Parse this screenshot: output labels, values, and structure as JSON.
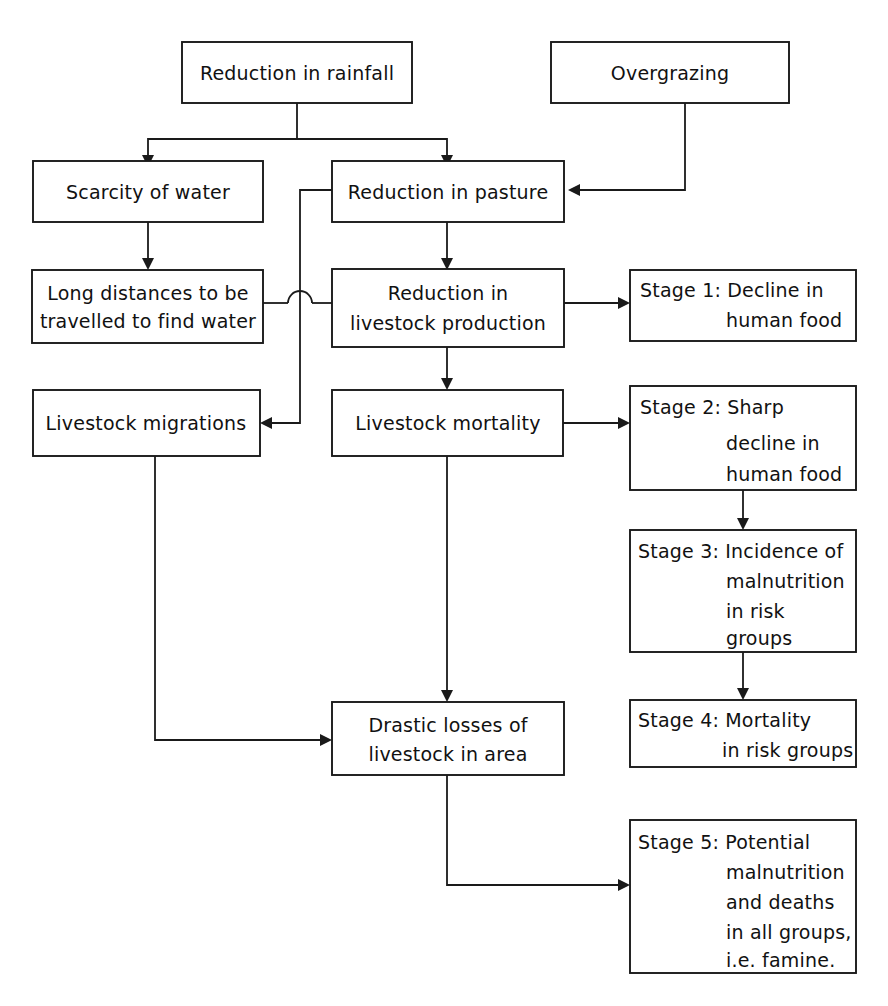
{
  "diagram": {
    "type": "flowchart",
    "colors": {
      "background": "#ffffff",
      "stroke": "#1a1a1a",
      "text": "#111111"
    },
    "nodes": [
      {
        "id": "reduction-in-rainfall",
        "lines": [
          "Reduction in rainfall"
        ],
        "align": "center"
      },
      {
        "id": "overgrazing",
        "lines": [
          "Overgrazing"
        ],
        "align": "center"
      },
      {
        "id": "scarcity-of-water",
        "lines": [
          "Scarcity of water"
        ],
        "align": "center"
      },
      {
        "id": "reduction-in-pasture",
        "lines": [
          "Reduction  in  pasture"
        ],
        "align": "center"
      },
      {
        "id": "long-distances-to-find-water",
        "lines": [
          "Long distances to be",
          "travelled to find water"
        ],
        "align": "center"
      },
      {
        "id": "reduction-in-livestock-production",
        "lines": [
          "Reduction  in",
          "livestock  production"
        ],
        "align": "center"
      },
      {
        "id": "stage-1-decline-in-human-food",
        "lines": [
          "Stage 1:  Decline in",
          "human food"
        ],
        "align": "stage"
      },
      {
        "id": "livestock-migrations",
        "lines": [
          "Livestock  migrations"
        ],
        "align": "center"
      },
      {
        "id": "livestock-mortality",
        "lines": [
          "Livestock  mortality"
        ],
        "align": "center"
      },
      {
        "id": "stage-2-sharp-decline-in-human-food",
        "lines": [
          "Stage 2:  Sharp",
          "decline in",
          "human food"
        ],
        "align": "stage"
      },
      {
        "id": "stage-3-incidence-of-malnutrition",
        "lines": [
          "Stage 3:  Incidence of",
          "malnutrition",
          "in risk",
          "groups"
        ],
        "align": "stage"
      },
      {
        "id": "stage-4-mortality-in-risk-groups",
        "lines": [
          "Stage 4:  Mortality",
          "in risk groups"
        ],
        "align": "stage"
      },
      {
        "id": "drastic-losses-of-livestock",
        "lines": [
          "Drastic losses of",
          "livestock in area"
        ],
        "align": "center"
      },
      {
        "id": "stage-5-potential-malnutrition-famine",
        "lines": [
          "Stage 5:  Potential",
          "malnutrition",
          "and  deaths",
          "in all groups,",
          "i.e. famine."
        ],
        "align": "stage"
      }
    ],
    "edges": [
      {
        "id": "rainfall-to-scarcity",
        "from": "reduction-in-rainfall",
        "to": "scarcity-of-water"
      },
      {
        "id": "rainfall-to-pasture",
        "from": "reduction-in-rainfall",
        "to": "reduction-in-pasture"
      },
      {
        "id": "overgrazing-to-pasture",
        "from": "overgrazing",
        "to": "reduction-in-pasture"
      },
      {
        "id": "scarcity-to-long-distances",
        "from": "scarcity-of-water",
        "to": "long-distances-to-find-water"
      },
      {
        "id": "pasture-to-livestock-production",
        "from": "reduction-in-pasture",
        "to": "reduction-in-livestock-production"
      },
      {
        "id": "long-distances-to-livestock-production",
        "from": "long-distances-to-find-water",
        "to": "reduction-in-livestock-production"
      },
      {
        "id": "livestock-production-to-stage1",
        "from": "reduction-in-livestock-production",
        "to": "stage-1-decline-in-human-food"
      },
      {
        "id": "livestock-production-to-mortality",
        "from": "reduction-in-livestock-production",
        "to": "livestock-mortality"
      },
      {
        "id": "pasture-to-migrations",
        "from": "reduction-in-pasture",
        "to": "livestock-migrations"
      },
      {
        "id": "mortality-to-stage2",
        "from": "livestock-mortality",
        "to": "stage-2-sharp-decline-in-human-food"
      },
      {
        "id": "mortality-to-drastic-losses",
        "from": "livestock-mortality",
        "to": "drastic-losses-of-livestock"
      },
      {
        "id": "migrations-to-drastic-losses",
        "from": "livestock-migrations",
        "to": "drastic-losses-of-livestock"
      },
      {
        "id": "stage2-to-stage3",
        "from": "stage-2-sharp-decline-in-human-food",
        "to": "stage-3-incidence-of-malnutrition"
      },
      {
        "id": "stage3-to-stage4",
        "from": "stage-3-incidence-of-malnutrition",
        "to": "stage-4-mortality-in-risk-groups"
      },
      {
        "id": "drastic-losses-to-stage5",
        "from": "drastic-losses-of-livestock",
        "to": "stage-5-potential-malnutrition-famine"
      }
    ]
  }
}
